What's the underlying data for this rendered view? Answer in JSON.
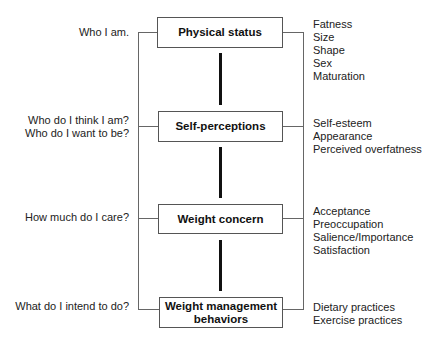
{
  "diagram": {
    "stages": [
      {
        "label": "Physical status",
        "question": "Who I am.",
        "attributes": [
          "Fatness",
          "Size",
          "Shape",
          "Sex",
          "Maturation"
        ]
      },
      {
        "label": "Self-perceptions",
        "question": "Who do I think I am?\nWho do I want to be?",
        "question_lines": [
          "Who do I think I am?",
          "Who do I want to be?"
        ],
        "attributes": [
          "Self-esteem",
          "Appearance",
          "Perceived overfatness"
        ]
      },
      {
        "label": "Weight concern",
        "question": "How much do I care?",
        "attributes": [
          "Acceptance",
          "Preoccupation",
          "Salience/Importance",
          "Satisfaction"
        ]
      },
      {
        "label_lines": [
          "Weight management",
          "behaviors"
        ],
        "label": "Weight management behaviors",
        "question": "What do I intend to do?",
        "attributes": [
          "Dietary practices",
          "Exercise practices"
        ]
      }
    ],
    "colors": {
      "box_border": "#555555",
      "connector": "#111111",
      "bracket": "#666666",
      "text": "#222222"
    }
  }
}
